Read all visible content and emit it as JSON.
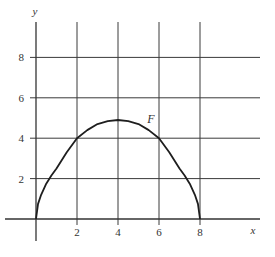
{
  "chart_data": {
    "type": "line",
    "title": "",
    "xlabel": "x",
    "ylabel": "y",
    "xlim": [
      -1,
      10.5
    ],
    "ylim": [
      -1,
      9.8
    ],
    "grid": true,
    "x_ticks": [
      2,
      4,
      6,
      8
    ],
    "y_ticks": [
      2,
      4,
      6,
      8
    ],
    "x_tick_labels": [
      "2",
      "4",
      "6",
      "8"
    ],
    "y_tick_labels": [
      "2",
      "4",
      "6",
      "8"
    ],
    "series": [
      {
        "name": "F",
        "x": [
          0,
          0.1,
          0.25,
          0.5,
          0.75,
          1,
          1.5,
          2,
          2.5,
          3,
          3.5,
          4,
          4.5,
          5,
          5.5,
          6,
          6.5,
          7,
          7.25,
          7.5,
          7.75,
          7.9,
          8
        ],
        "y": [
          0,
          0.75,
          1.2,
          1.75,
          2.15,
          2.5,
          3.3,
          4.0,
          4.4,
          4.7,
          4.85,
          4.9,
          4.85,
          4.7,
          4.4,
          4.0,
          3.3,
          2.5,
          2.15,
          1.75,
          1.2,
          0.75,
          0
        ]
      }
    ],
    "annotations": [
      {
        "text": "F",
        "x": 5.6,
        "y": 4.75
      }
    ]
  }
}
